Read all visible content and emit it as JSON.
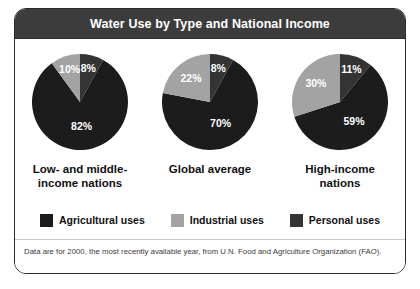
{
  "figure": {
    "title": "Water Use by Type and National Income",
    "footnote": "Data are for 2000, the most recently available year, from U.N. Food and Agriculture Organization (FAO).",
    "colors": {
      "agricultural": "#1c1c1c",
      "industrial": "#a3a3a3",
      "personal": "#343434",
      "header_bg": "#3c3c3c",
      "header_text": "#ffffff",
      "border": "#2b2b2b",
      "panel_bg": "#ffffff",
      "label_text": "#111111",
      "footnote_text": "#3a3a3a"
    }
  },
  "legend": {
    "items": [
      {
        "label": "Agricultural uses",
        "color": "#1c1c1c",
        "key": "agricultural"
      },
      {
        "label": "Industrial uses",
        "color": "#a3a3a3",
        "key": "industrial"
      },
      {
        "label": "Personal uses",
        "color": "#343434",
        "key": "personal"
      }
    ]
  },
  "chart_data": {
    "type": "pie",
    "title": "Water Use by Type and National Income",
    "subtitle": "",
    "xlabel": "",
    "ylabel": "",
    "legend_position": "bottom",
    "value_unit": "%",
    "categories": [
      "Agricultural uses",
      "Industrial uses",
      "Personal uses"
    ],
    "charts": [
      {
        "name": "Low- and middle-income nations",
        "label_lines": [
          "Low- and middle-",
          "income nations"
        ],
        "slices": [
          {
            "name": "Agricultural uses",
            "value": 82,
            "display": "82%",
            "color": "#1c1c1c"
          },
          {
            "name": "Industrial uses",
            "value": 10,
            "display": "10%",
            "color": "#a3a3a3"
          },
          {
            "name": "Personal uses",
            "value": 8,
            "display": "8%",
            "color": "#343434"
          }
        ]
      },
      {
        "name": "Global average",
        "label_lines": [
          "Global average"
        ],
        "slices": [
          {
            "name": "Agricultural uses",
            "value": 70,
            "display": "70%",
            "color": "#1c1c1c"
          },
          {
            "name": "Industrial uses",
            "value": 22,
            "display": "22%",
            "color": "#a3a3a3"
          },
          {
            "name": "Personal uses",
            "value": 8,
            "display": "8%",
            "color": "#343434"
          }
        ]
      },
      {
        "name": "High-income nations",
        "label_lines": [
          "High-income",
          "nations"
        ],
        "slices": [
          {
            "name": "Agricultural uses",
            "value": 59,
            "display": "59%",
            "color": "#1c1c1c"
          },
          {
            "name": "Industrial uses",
            "value": 30,
            "display": "30%",
            "color": "#a3a3a3"
          },
          {
            "name": "Personal uses",
            "value": 11,
            "display": "11%",
            "color": "#343434"
          }
        ]
      }
    ]
  }
}
